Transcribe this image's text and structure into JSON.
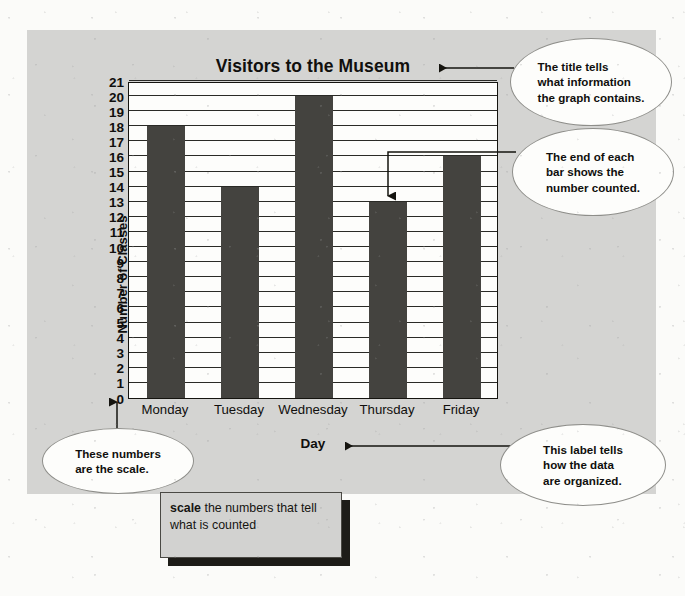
{
  "chart_data": {
    "type": "bar",
    "title": "Visitors to the Museum",
    "xlabel": "Day",
    "ylabel": "Number of Classes",
    "categories": [
      "Monday",
      "Tuesday",
      "Wednesday",
      "Thursday",
      "Friday"
    ],
    "values": [
      18,
      14,
      20,
      13,
      16
    ],
    "ylim": [
      0,
      21
    ],
    "ytick_labels": [
      "21",
      "20",
      "19",
      "18",
      "17",
      "16",
      "15",
      "14",
      "13",
      "12",
      "11",
      "10",
      "9",
      "8",
      "7",
      "6",
      "5",
      "4",
      "3",
      "2",
      "1",
      "0"
    ],
    "ytick_step": 1,
    "grid": true,
    "legend": "none",
    "bar_color": "#44433f",
    "plot_background": "#fdfdfb",
    "axis_color": "#15140f"
  },
  "panel": {
    "background_color": "#d4d4d2"
  },
  "callouts": [
    {
      "id": "title",
      "lines": [
        "The title tells",
        "what information",
        "the graph contains."
      ],
      "points_to": "chart-title"
    },
    {
      "id": "bar-end",
      "lines": [
        "The end of each",
        "bar shows the",
        "number counted."
      ],
      "points_to": "thursday-bar-top"
    },
    {
      "id": "scale",
      "lines": [
        "These numbers",
        "are the scale."
      ],
      "points_to": "y-axis-ticks"
    },
    {
      "id": "x-label",
      "lines": [
        "This label tells",
        "how the data",
        "are organized."
      ],
      "points_to": "x-axis-title"
    }
  ],
  "definition": {
    "term": "scale",
    "text": "the numbers that tell what is counted"
  }
}
